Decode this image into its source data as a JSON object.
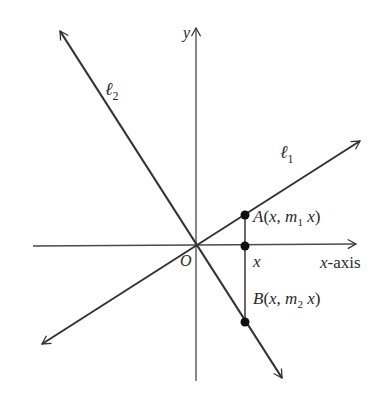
{
  "diagram": {
    "colors": {
      "background": "#ffffff",
      "line": "#333333",
      "axis": "#4a4a4a",
      "point": "#111111",
      "text": "#2a2a2a"
    },
    "origin": {
      "x": 196,
      "y": 246,
      "label": "O"
    },
    "axes": {
      "x_axis": {
        "x1": 33,
        "y1": 246,
        "x2": 356,
        "y2": 244,
        "label": "x-axis"
      },
      "y_axis": {
        "x1": 196,
        "y1": 381,
        "x2": 196,
        "y2": 28,
        "label": "y"
      }
    },
    "lines": [
      {
        "id": "l1",
        "name": "ℓ",
        "subscript": "1",
        "x1": 42,
        "y1": 344,
        "x2": 360,
        "y2": 141,
        "label_x": 280,
        "label_y": 158
      },
      {
        "id": "l2",
        "name": "ℓ",
        "subscript": "2",
        "x1": 60,
        "y1": 31,
        "x2": 282,
        "y2": 378,
        "label_x": 105,
        "label_y": 95
      }
    ],
    "segment": {
      "x": 245,
      "y1": 215,
      "y2": 322
    },
    "points": [
      {
        "id": "A",
        "x": 245,
        "y": 215,
        "label_main": "A(x, m",
        "label_sub": "1",
        "label_end": " x)",
        "label_x": 253,
        "label_y": 222
      },
      {
        "id": "xpt",
        "x": 245,
        "y": 246,
        "label_main": "x",
        "label_sub": "",
        "label_end": "",
        "label_x": 253,
        "label_y": 267
      },
      {
        "id": "B",
        "x": 245,
        "y": 322,
        "label_main": "B(x, m",
        "label_sub": "2",
        "label_end": " x)",
        "label_x": 253,
        "label_y": 304
      }
    ]
  }
}
